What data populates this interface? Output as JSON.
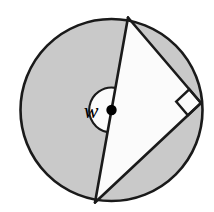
{
  "figure": {
    "kind": "geometry-diagram",
    "canvas": {
      "width": 214,
      "height": 212,
      "background": "#ffffff"
    },
    "colors": {
      "shaded_region": "#c9c9c9",
      "unshaded_region": "#fbfbfb",
      "stroke": "#1a1a1a",
      "label_text": "#000000",
      "vertex_dot": "#000000"
    },
    "circle": {
      "label": "circle",
      "center": {
        "x": 111.5,
        "y": 110
      },
      "radius": 91,
      "stroke_width": 2.6
    },
    "points": [
      {
        "id": "A",
        "role": "top-vertex-on-circle",
        "x": 128,
        "y": 17.5
      },
      {
        "id": "B",
        "role": "bottom-vertex-on-circle",
        "x": 95,
        "y": 202.5
      },
      {
        "id": "C",
        "role": "right-angle-vertex-on-circle",
        "x": 201,
        "y": 103
      },
      {
        "id": "O",
        "role": "circle-center-dot",
        "x": 111.5,
        "y": 110
      }
    ],
    "segments": [
      {
        "id": "AB",
        "role": "diameter-through-center",
        "from": "A",
        "to": "B",
        "stroke_width": 2.6
      },
      {
        "id": "AC",
        "role": "chord-upper-right",
        "from": "A",
        "to": "C",
        "stroke_width": 2.6
      },
      {
        "id": "BC",
        "role": "chord-lower-right",
        "from": "B",
        "to": "C",
        "stroke_width": 2.6
      }
    ],
    "center_dot": {
      "label": "center point",
      "cx": 111.5,
      "cy": 110,
      "r": 5.2
    },
    "angle_marker": {
      "label": "w",
      "type": "semicircular-arc-sector",
      "vertex": "O",
      "radius": 22.5,
      "side": "left-of-diameter",
      "fill": "#fbfbfb",
      "label_position": {
        "x": 91,
        "y": 118
      },
      "label_font_size": 22
    },
    "right_angle_marker": {
      "label": "right angle",
      "type": "square",
      "at_vertex": "C",
      "size": 18,
      "fill": "#fbfbfb"
    },
    "shaded_regions": [
      {
        "id": "major-left-region",
        "description": "large circle area left of the diameter AB, excluding the w angle marker"
      },
      {
        "id": "upper-right-segment",
        "description": "circular segment between chord AC and the arc"
      },
      {
        "id": "lower-right-segment",
        "description": "circular segment between chord BC and the arc"
      }
    ],
    "unshaded_regions": [
      {
        "id": "triangle-ABC",
        "description": "inscribed right triangle interior"
      },
      {
        "id": "angle-marker-w",
        "description": "semicircular angle marker labelled w"
      }
    ]
  }
}
